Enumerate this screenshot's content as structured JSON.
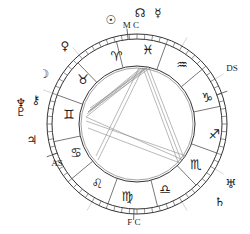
{
  "chart": {
    "center": [
      137,
      124
    ],
    "radii": {
      "outer": 90,
      "tick_inner": 85,
      "zodiac_inner": 58,
      "aspect_circle": 56
    },
    "colors": {
      "line": "#333333",
      "aspect": "#8a8a8a",
      "background": "#ffffff"
    },
    "angles": [
      {
        "id": "mc",
        "label": "M C",
        "x": 131,
        "y": 25
      },
      {
        "id": "ds",
        "label": "DS",
        "x": 232,
        "y": 68
      },
      {
        "id": "fc",
        "label": "F C",
        "x": 134,
        "y": 222
      },
      {
        "id": "as",
        "label": "AS",
        "x": 57,
        "y": 163
      }
    ],
    "signs": [
      {
        "name": "aries",
        "glyph": "♈",
        "x": 116,
        "y": 56
      },
      {
        "name": "pisces",
        "glyph": "♓",
        "x": 148,
        "y": 49
      },
      {
        "name": "aquarius",
        "glyph": "♒",
        "x": 182,
        "y": 64
      },
      {
        "name": "capricorn",
        "glyph": "♑",
        "x": 207,
        "y": 97
      },
      {
        "name": "sagittarius",
        "glyph": "♐",
        "x": 214,
        "y": 134
      },
      {
        "name": "scorpio",
        "glyph": "♏",
        "x": 196,
        "y": 164
      },
      {
        "name": "libra",
        "glyph": "♎",
        "x": 165,
        "y": 189
      },
      {
        "name": "virgo",
        "glyph": "♍",
        "x": 127,
        "y": 196
      },
      {
        "name": "leo",
        "glyph": "♌",
        "x": 97,
        "y": 183
      },
      {
        "name": "cancer",
        "glyph": "♋",
        "x": 76,
        "y": 152
      },
      {
        "name": "gemini",
        "glyph": "♊",
        "x": 69,
        "y": 114
      },
      {
        "name": "taurus",
        "glyph": "♉",
        "x": 83,
        "y": 79
      }
    ],
    "planets": [
      {
        "name": "sun",
        "glyph": "☉",
        "x": 111,
        "y": 20
      },
      {
        "name": "north-node",
        "glyph": "☊",
        "x": 140,
        "y": 13
      },
      {
        "name": "mercury",
        "glyph": "☿",
        "x": 158,
        "y": 13
      },
      {
        "name": "venus",
        "glyph": "♀",
        "x": 65,
        "y": 46
      },
      {
        "name": "moon",
        "glyph": "☽",
        "x": 44,
        "y": 74
      },
      {
        "name": "neptune",
        "glyph": "♆",
        "x": 21,
        "y": 103
      },
      {
        "name": "pluto",
        "glyph": "♇",
        "x": 21,
        "y": 112
      },
      {
        "name": "chiron",
        "glyph": "⚷",
        "x": 36,
        "y": 100
      },
      {
        "name": "jupiter",
        "glyph": "♃",
        "x": 32,
        "y": 140
      },
      {
        "name": "uranus",
        "glyph": "♅",
        "x": 231,
        "y": 184
      },
      {
        "name": "saturn",
        "glyph": "♄",
        "x": 220,
        "y": 202
      }
    ],
    "house_cusps_deg": [
      110,
      140,
      168,
      200,
      226,
      256,
      290,
      320,
      348,
      20,
      46,
      76
    ],
    "aspect_lines": [
      [
        143,
        68,
        88,
        112
      ],
      [
        145,
        68,
        87,
        114
      ],
      [
        147,
        68,
        86,
        117
      ],
      [
        141,
        68,
        90,
        110
      ],
      [
        143,
        68,
        178,
        162
      ],
      [
        146,
        68,
        181,
        160
      ],
      [
        149,
        68,
        184,
        158
      ],
      [
        143,
        68,
        98,
        160
      ],
      [
        139,
        68,
        96,
        156
      ],
      [
        86,
        117,
        183,
        160
      ],
      [
        86,
        121,
        186,
        156
      ],
      [
        88,
        128,
        180,
        163
      ],
      [
        88,
        112,
        150,
        68
      ],
      [
        90,
        108,
        148,
        67
      ]
    ]
  }
}
